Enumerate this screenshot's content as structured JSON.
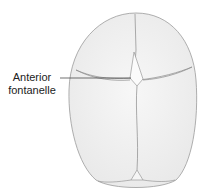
{
  "diagram": {
    "labels": {
      "anterior_fontanelle_line1": "Anterior",
      "anterior_fontanelle_line2": "fontanelle"
    }
  }
}
